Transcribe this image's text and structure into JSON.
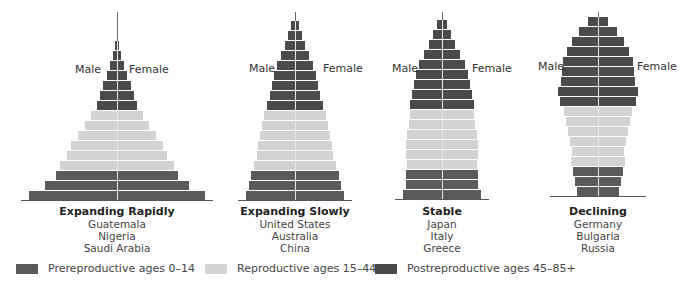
{
  "figure": {
    "side_labels": {
      "male": "Male",
      "female": "Female"
    },
    "pyramids": [
      {
        "title": "Expanding Rapidly",
        "examples": [
          "Guatemala",
          "Nigeria",
          "Saudi Arabia"
        ],
        "center_x": 117,
        "baseline_y": 200,
        "male_label_x": 75,
        "female_label_x": 129,
        "label_y": 63,
        "half_widths_bottom_to_top": {
          "prereproductive": [
            88,
            72,
            61
          ],
          "reproductive": [
            57,
            50,
            46,
            39,
            32,
            26
          ],
          "postreproductive": [
            20,
            17,
            14,
            10,
            7,
            4,
            2
          ]
        },
        "spike_top_y": 12
      },
      {
        "title": "Expanding Slowly",
        "examples": [
          "United States",
          "Australia",
          "China"
        ],
        "center_x": 295,
        "baseline_y": 200,
        "male_label_x": 249,
        "female_label_x": 323,
        "label_y": 62,
        "half_widths_bottom_to_top": {
          "prereproductive": [
            49,
            46,
            44
          ],
          "reproductive": [
            41,
            38,
            37,
            35,
            33,
            31
          ],
          "postreproductive": [
            28,
            25,
            23,
            21,
            18,
            14,
            10,
            7,
            4
          ]
        },
        "spike_top_y": 12
      },
      {
        "title": "Stable",
        "examples": [
          "Japan",
          "Italy",
          "Greece"
        ],
        "center_x": 442,
        "baseline_y": 199,
        "male_label_x": 392,
        "female_label_x": 472,
        "label_y": 62,
        "half_widths_bottom_to_top": {
          "prereproductive": [
            39,
            36,
            36
          ],
          "reproductive": [
            35,
            36,
            36,
            35,
            33,
            32
          ],
          "postreproductive": [
            32,
            30,
            28,
            26,
            23,
            18,
            13,
            9,
            5
          ]
        },
        "spike_top_y": 12
      },
      {
        "title": "Declining",
        "examples": [
          "Germany",
          "Bulgaria",
          "Russia"
        ],
        "center_x": 598,
        "baseline_y": 196,
        "male_label_x": 538,
        "female_label_x": 637,
        "label_y": 60,
        "half_widths_bottom_to_top": {
          "prereproductive": [
            21,
            23,
            25
          ],
          "reproductive": [
            27,
            26,
            28,
            30,
            32,
            34
          ],
          "postreproductive": [
            38,
            40,
            37,
            36,
            35,
            31,
            26,
            19,
            10
          ]
        },
        "spike_top_y": 12
      }
    ],
    "legend": [
      {
        "key": "prereproductive",
        "label": "Prereproductive ages 0–14",
        "color": "#5a5a5a",
        "x": 16
      },
      {
        "key": "reproductive",
        "label": "Reproductive ages 15–44",
        "color": "#d3d3d3",
        "x": 205
      },
      {
        "key": "postreproductive",
        "label": "Postreproductive ages 45–85+",
        "color": "#4a4a4a",
        "x": 375
      }
    ],
    "colors": {
      "prereproductive": "#5a5a5a",
      "reproductive": "#d3d3d3",
      "postreproductive": "#4a4a4a",
      "axis": "#e8e8e8",
      "baseline": "#555555"
    }
  }
}
